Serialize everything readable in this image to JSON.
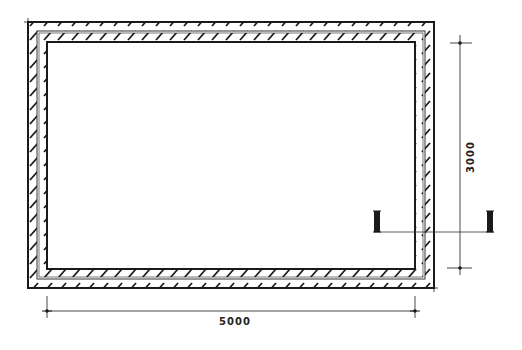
{
  "drawing": {
    "type": "floor-plan",
    "description": "Rectangular room with double-layer hatched walls",
    "line_color": "#1a1a1a",
    "background": "#ffffff"
  },
  "dimensions": {
    "width_label": "5000",
    "height_label": "3000"
  },
  "section_marker": {
    "label": "section-cut",
    "left_x": 377,
    "right_x": 490,
    "y": 232
  }
}
